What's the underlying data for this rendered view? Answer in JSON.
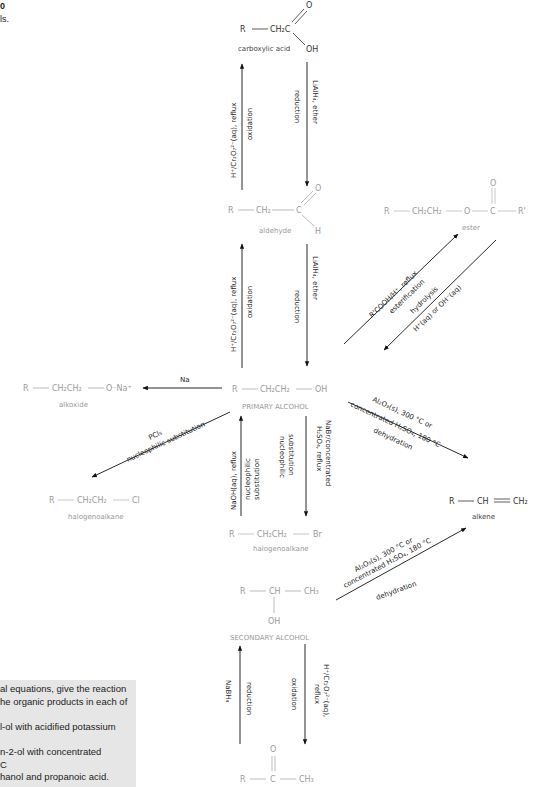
{
  "corner": {
    "fig_number": "0",
    "caption_tail": "ls."
  },
  "question_box": {
    "background": "#e6e6e6",
    "lines": [
      "al equations, give the reaction",
      "he organic products in each of",
      "",
      "l-ol with acidified potassium",
      "",
      "n-2-ol with concentrated",
      "C",
      "hanol and propanoic acid."
    ]
  },
  "compounds": {
    "carboxylic_acid": {
      "name": "carboxylic acid",
      "R": "R",
      "chain": "CH₂C",
      "O": "O",
      "OH": "OH"
    },
    "aldehyde": {
      "name": "aldehyde",
      "R": "R",
      "chain": "CH₂",
      "C": "C",
      "O": "O",
      "H": "H"
    },
    "ester": {
      "name": "ester",
      "R": "R",
      "chain": "CH₂CH₂",
      "O_link": "O",
      "C": "C",
      "O": "O",
      "R2": "R'"
    },
    "primary_alcohol": {
      "name": "PRIMARY ALCOHOL",
      "R": "R",
      "chain": "CH₂CH₂",
      "OH": "OH"
    },
    "alkoxide": {
      "name": "alkoxide",
      "R": "R",
      "chain": "CH₂CH₂",
      "end": "O⁻Na⁺"
    },
    "halogenoalkane_cl": {
      "name": "halogenoalkane",
      "R": "R",
      "chain": "CH₂CH₂",
      "end": "Cl"
    },
    "halogenoalkane_br": {
      "name": "halogenoalkane",
      "R": "R",
      "chain": "CH₂CH₂",
      "end": "Br"
    },
    "alkene": {
      "name": "alkene",
      "R": "R",
      "CH": "CH",
      "CH2": "CH₂"
    },
    "secondary_alcohol": {
      "name": "SECONDARY ALCOHOL",
      "R": "R",
      "CH": "CH",
      "CH3": "CH₃",
      "OH": "OH"
    },
    "ketone": {
      "R": "R",
      "C": "C",
      "O": "O",
      "CH3": "CH₃"
    }
  },
  "reactions": {
    "acid_from_aldehyde": {
      "reagent": "H⁺/Cr₂O₇²⁻(aq), reflux",
      "type": "oxidation"
    },
    "acid_to_aldehyde": {
      "reagent": "LiAlH₄, ether",
      "type": "reduction"
    },
    "aldehyde_from_alcohol": {
      "reagent": "H⁺/Cr₂O₇²⁻(aq), reflux",
      "type": "oxidation"
    },
    "aldehyde_to_alcohol": {
      "reagent": "LiAlH₄, ether",
      "type": "reduction"
    },
    "esterification": {
      "reagent": "R'COOH/H⁺, reflux",
      "type": "esterification"
    },
    "hydrolysis": {
      "reagent": "H⁺(aq) or OH⁻(aq)",
      "type": "hydrolysis"
    },
    "alkoxide": {
      "reagent": "Na"
    },
    "chlorination": {
      "reagent": "PCl₅",
      "type": "nucleophilic substitution"
    },
    "from_bromide": {
      "reagent": "NaOH(aq), reflux",
      "type_line1": "nucleophilic",
      "type_line2": "substitution"
    },
    "to_bromide": {
      "reagent_line1": "NaBr/concentrated",
      "reagent_line2": "H₂SO₄, reflux",
      "type_line1": "nucleophilic",
      "type_line2": "substitution"
    },
    "dehydration_primary": {
      "line1": "Al₂O₃(s), 300 °C or",
      "line2": "concentrated H₂SO₄, 180 °C",
      "type": "dehydration"
    },
    "dehydration_secondary": {
      "line1": "Al₂O₃(s), 300 °C or",
      "line2": "concentrated H₂SO₄, 180 °C",
      "type": "dehydration"
    },
    "ketone_reduction": {
      "reagent": "NaBH₄",
      "type": "reduction"
    },
    "secondary_oxidation": {
      "reagent_line1": "H⁺/Cr₂O₇²⁻(aq),",
      "reagent_line2": "reflux",
      "type": "oxidation"
    }
  }
}
